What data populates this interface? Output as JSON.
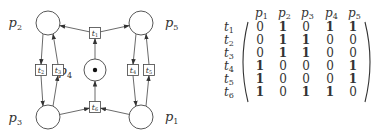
{
  "diagram": {
    "type": "petri-net",
    "places": [
      {
        "id": "p1",
        "label": "p",
        "sub": "1",
        "cx": 141,
        "cy": 117,
        "tokens": 0
      },
      {
        "id": "p2",
        "label": "p",
        "sub": "2",
        "cx": 48,
        "cy": 23,
        "tokens": 0
      },
      {
        "id": "p3",
        "label": "p",
        "sub": "3",
        "cx": 48,
        "cy": 117,
        "tokens": 0
      },
      {
        "id": "p4",
        "label": "p",
        "sub": "4",
        "cx": 95,
        "cy": 70,
        "tokens": 1
      },
      {
        "id": "p5",
        "label": "p",
        "sub": "5",
        "cx": 141,
        "cy": 23,
        "tokens": 0
      }
    ],
    "transitions": [
      {
        "id": "t1",
        "label": "t",
        "sub": "1",
        "x": 95,
        "y": 33
      },
      {
        "id": "t2",
        "label": "t",
        "sub": "2",
        "x": 41,
        "y": 70
      },
      {
        "id": "t3",
        "label": "t",
        "sub": "3",
        "x": 58,
        "y": 70
      },
      {
        "id": "t4",
        "label": "t",
        "sub": "4",
        "x": 133,
        "y": 70
      },
      {
        "id": "t5",
        "label": "t",
        "sub": "5",
        "x": 149,
        "y": 70
      },
      {
        "id": "t6",
        "label": "t",
        "sub": "6",
        "x": 95,
        "y": 107
      }
    ],
    "arcs": [
      {
        "from": "t1",
        "to": "p2"
      },
      {
        "from": "t1",
        "to": "p5"
      },
      {
        "from": "p4",
        "to": "t1"
      },
      {
        "from": "p2",
        "to": "t2"
      },
      {
        "from": "t2",
        "to": "p3"
      },
      {
        "from": "p3",
        "to": "t3"
      },
      {
        "from": "t3",
        "to": "p2"
      },
      {
        "from": "p5",
        "to": "t4"
      },
      {
        "from": "t4",
        "to": "p1"
      },
      {
        "from": "p1",
        "to": "t5"
      },
      {
        "from": "t5",
        "to": "p5"
      },
      {
        "from": "p3",
        "to": "t6"
      },
      {
        "from": "p1",
        "to": "t6"
      },
      {
        "from": "t6",
        "to": "p4"
      }
    ]
  },
  "matrix": {
    "column_headers": [
      {
        "label": "p",
        "sub": "1"
      },
      {
        "label": "p",
        "sub": "2"
      },
      {
        "label": "p",
        "sub": "3"
      },
      {
        "label": "p",
        "sub": "4"
      },
      {
        "label": "p",
        "sub": "5"
      }
    ],
    "row_headers": [
      {
        "label": "t",
        "sub": "1"
      },
      {
        "label": "t",
        "sub": "2"
      },
      {
        "label": "t",
        "sub": "3"
      },
      {
        "label": "t",
        "sub": "4"
      },
      {
        "label": "t",
        "sub": "5"
      },
      {
        "label": "t",
        "sub": "6"
      }
    ],
    "rows": [
      [
        "0",
        "1",
        "0",
        "1",
        "1"
      ],
      [
        "0",
        "1",
        "1",
        "0",
        "0"
      ],
      [
        "0",
        "1",
        "1",
        "0",
        "0"
      ],
      [
        "1",
        "0",
        "0",
        "0",
        "1"
      ],
      [
        "1",
        "0",
        "0",
        "0",
        "1"
      ],
      [
        "1",
        "0",
        "1",
        "1",
        "0"
      ]
    ]
  }
}
